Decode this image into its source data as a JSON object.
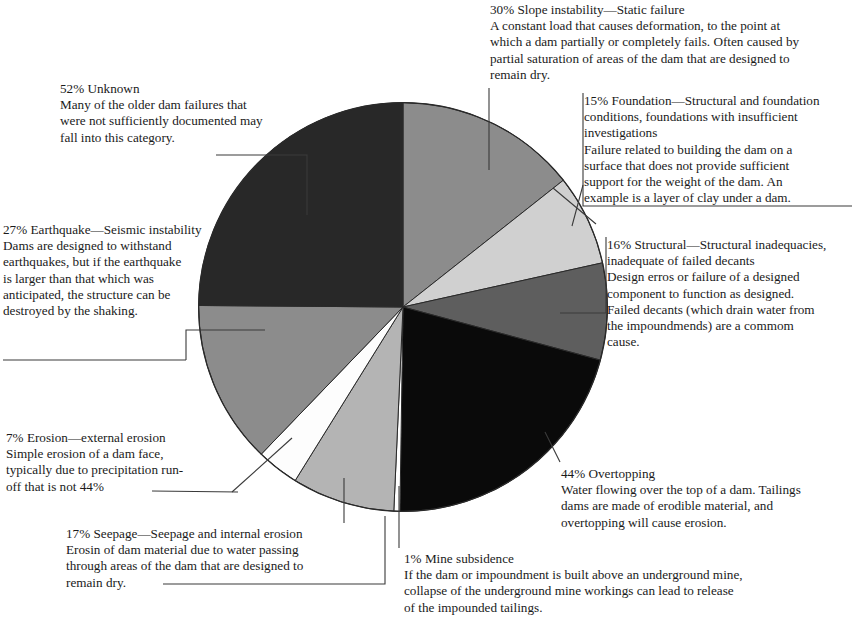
{
  "chart_data": {
    "type": "pie",
    "title": "",
    "units": "percent",
    "note": "Percentages describe share of incidents per cause and are labeled directly on each callout; they do not sum to 100.",
    "center": {
      "x": 403,
      "y": 307
    },
    "radius": 205,
    "start_angle_deg": 0,
    "direction": "clockwise",
    "categories": [
      "Slope instability",
      "Foundation",
      "Structural",
      "Overtopping",
      "Mine subsidence",
      "Seepage",
      "Erosion",
      "Earthquake",
      "Unknown"
    ],
    "values": [
      30,
      15,
      16,
      44,
      1,
      17,
      7,
      27,
      52
    ],
    "colors": [
      "#8c8c8c",
      "#d0d0d0",
      "#5e5e5e",
      "#0a0a0a",
      "#ffffff",
      "#b4b4b4",
      "#fdfdfd",
      "#8c8c8c",
      "#282828"
    ],
    "slices": [
      {
        "label": "Slope instability",
        "value": 30,
        "color": "#8c8c8c",
        "start_deg": 0,
        "end_deg": 51.67
      },
      {
        "label": "Foundation",
        "value": 15,
        "color": "#d0d0d0",
        "start_deg": 51.67,
        "end_deg": 77.51
      },
      {
        "label": "Structural",
        "value": 16,
        "color": "#5e5e5e",
        "start_deg": 77.51,
        "end_deg": 105.07
      },
      {
        "label": "Overtopping",
        "value": 44,
        "color": "#0a0a0a",
        "start_deg": 105.07,
        "end_deg": 180.86
      },
      {
        "label": "Mine subsidence",
        "value": 1,
        "color": "#ffffff",
        "start_deg": 180.86,
        "end_deg": 182.58
      },
      {
        "label": "Seepage",
        "value": 17,
        "color": "#b4b4b4",
        "start_deg": 182.58,
        "end_deg": 211.86
      },
      {
        "label": "Erosion",
        "value": 7,
        "color": "#fdfdfd",
        "start_deg": 211.86,
        "end_deg": 223.92
      },
      {
        "label": "Earthquake",
        "value": 27,
        "color": "#8c8c8c",
        "start_deg": 223.92,
        "end_deg": 270.43
      },
      {
        "label": "Unknown",
        "value": 52,
        "color": "#282828",
        "start_deg": 270.43,
        "end_deg": 360
      }
    ],
    "legend": "callouts",
    "grid": false
  },
  "callouts": {
    "slope": {
      "head": "30% Slope instability—Static failure",
      "body": "A constant load that causes deformation, to the point at\nwhich a dam partially or completely fails. Often caused by\npartial saturation of areas of the dam that are designed to\nremain dry."
    },
    "foundation": {
      "head": "15% Foundation—Structural and foundation\nconditions, foundations with insufficient\ninvestigations",
      "body": "Failure related to building the dam on a\nsurface that does not provide sufficient\nsupport for the weight  of the dam. An\nexample is a layer of clay under a dam."
    },
    "structural": {
      "head": "16% Structural—Structural inadequacies,\ninadequate of failed decants",
      "body": "Design erros or failure of a designed\ncomponent to function as designed.\nFailed decants (which drain water from\nthe impoundmends) are a commom\ncause."
    },
    "overtopping": {
      "head": "44% Overtopping",
      "body": "Water flowing over the top of a dam. Tailings\ndams are made of erodible material, and\novertopping will cause erosion."
    },
    "mine": {
      "head": "1% Mine subsidence",
      "body": "If the dam or impoundment is built above an underground mine,\ncollapse of the underground mine workings can lead to release\nof the impounded tailings."
    },
    "seepage": {
      "head": "17% Seepage—Seepage and internal erosion",
      "body": "Erosin of dam material due to water passing\nthrough areas of the dam that are designed to\nremain dry."
    },
    "erosion": {
      "head": "7% Erosion—external erosion",
      "body": "Simple erosion of a dam face,\ntypically due to precipitation run-\noff that is not 44%"
    },
    "earthquake": {
      "head": "27% Earthquake—Seismic instability",
      "body": "Dams are designed to withstand\nearthquakes, but if the earthquake\nis larger than that which was\nanticipated, the structure can be\ndestroyed by the shaking."
    },
    "unknown": {
      "head": "52% Unknown",
      "body": "Many of the older dam failures that\nwere not sufficiently documented may\nfall into this category."
    }
  }
}
